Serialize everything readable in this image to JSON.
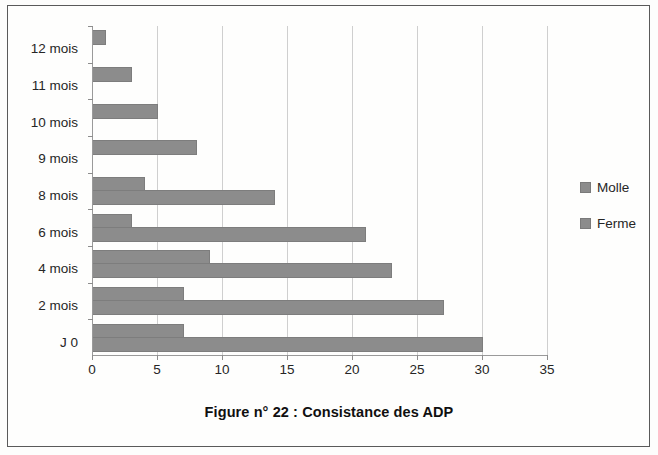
{
  "figure": {
    "title": "Figure n°  22 : Consistance des ADP"
  },
  "legend": {
    "position": "right",
    "items": [
      {
        "label": "Molle",
        "color": "#8c8c8c"
      },
      {
        "label": "Ferme",
        "color": "#8c8c8c"
      }
    ]
  },
  "axes": {
    "x_ticks": [
      "0",
      "5",
      "10",
      "15",
      "20",
      "25",
      "30",
      "35"
    ],
    "y_ticks": [
      "12 mois",
      "11 mois",
      "10 mois",
      "9 mois",
      "8 mois",
      "6 mois",
      "4 mois",
      "2 mois",
      "J 0"
    ]
  },
  "chart_data": {
    "type": "bar",
    "orientation": "horizontal",
    "title": "Figure n°  22 : Consistance des ADP",
    "xlabel": "",
    "ylabel": "",
    "xlim": [
      0,
      35
    ],
    "xticks": [
      0,
      5,
      10,
      15,
      20,
      25,
      30,
      35
    ],
    "grid": true,
    "legend_position": "right",
    "categories": [
      "J 0",
      "2 mois",
      "4 mois",
      "6 mois",
      "8 mois",
      "9 mois",
      "10 mois",
      "11 mois",
      "12 mois"
    ],
    "series": [
      {
        "name": "Ferme",
        "color": "#8c8c8c",
        "values": [
          30,
          27,
          23,
          21,
          14,
          0,
          0,
          0,
          0
        ]
      },
      {
        "name": "Molle",
        "color": "#8c8c8c",
        "values": [
          7,
          7,
          9,
          3,
          4,
          8,
          5,
          3,
          1
        ]
      }
    ]
  }
}
